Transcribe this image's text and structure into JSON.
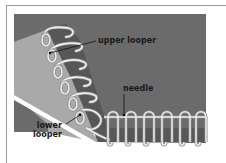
{
  "diagram": {
    "labels": {
      "upper_looper": "upper looper",
      "needle": "needle",
      "lower_looper_line1": "lower",
      "lower_looper_line2": "looper"
    },
    "colors": {
      "background": "#6b6b6b",
      "fabric_light": "#a8a8a8",
      "fabric_dark": "#565656",
      "thread": "#e8e8e8",
      "thread_outline": "#8a8a8a",
      "frame": "#9a9a9a",
      "label_text": "#1a1a1a"
    }
  }
}
